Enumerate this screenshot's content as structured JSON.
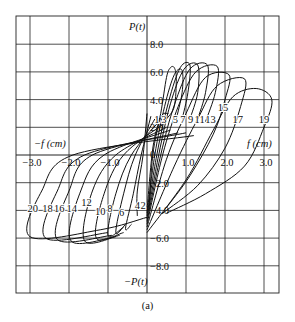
{
  "chart_data": {
    "type": "line",
    "title": "",
    "caption": "(a)",
    "xlabel_pos": "f (cm)",
    "xlabel_neg": "−f (cm)",
    "ylabel_pos": "P(t)",
    "ylabel_neg": "−P(t)",
    "xlim": [
      -3.3,
      3.4
    ],
    "ylim": [
      -10.0,
      10.2
    ],
    "grid": true,
    "x_ticks": [
      -3.0,
      -2.0,
      -1.0,
      0,
      1.0,
      2.0,
      3.0
    ],
    "x_tick_labels": [
      "−3.0",
      "−2.0",
      "−1.0",
      "0",
      "1.0",
      "2.0",
      "3.0"
    ],
    "y_ticks": [
      8.0,
      6.0,
      4.0,
      2.0,
      0,
      -2.0,
      -4.0,
      -6.0,
      -8.0
    ],
    "y_tick_labels": [
      "8.0",
      "6.0",
      "4.0",
      "2.0",
      "0",
      "−2.0",
      "−4.0",
      "−6.0",
      "−8.0"
    ],
    "legend": "Cycle numbers labeled on curves: odd 1–19 (loading, positive), even 2–20 (reverse loading, negative)",
    "series": [
      {
        "name": "1",
        "points": [
          [
            0.05,
            -4.0
          ],
          [
            0.15,
            0.0
          ],
          [
            0.35,
            2.7
          ],
          [
            0.55,
            3.0
          ]
        ],
        "label_at": [
          0.25,
          2.3
        ]
      },
      {
        "name": "3",
        "points": [
          [
            0.0,
            -4.0
          ],
          [
            0.15,
            0.5
          ],
          [
            0.35,
            3.0
          ],
          [
            0.5,
            5.6
          ],
          [
            0.6,
            6.3
          ],
          [
            0.7,
            6.3
          ],
          [
            0.75,
            5.5
          ],
          [
            0.7,
            3.5
          ],
          [
            0.5,
            2.6
          ]
        ],
        "label_at": [
          0.43,
          2.3
        ]
      },
      {
        "name": "5",
        "points": [
          [
            0.0,
            -4.2
          ],
          [
            0.2,
            0.0
          ],
          [
            0.45,
            3.5
          ],
          [
            0.7,
            5.8
          ],
          [
            0.9,
            6.1
          ],
          [
            0.9,
            4.5
          ],
          [
            0.75,
            2.6
          ]
        ],
        "label_at": [
          0.73,
          2.3
        ]
      },
      {
        "name": "7",
        "points": [
          [
            0.0,
            -4.4
          ],
          [
            0.25,
            0.0
          ],
          [
            0.55,
            3.8
          ],
          [
            0.85,
            6.3
          ],
          [
            1.1,
            6.5
          ],
          [
            1.05,
            4.5
          ],
          [
            0.9,
            2.6
          ]
        ],
        "label_at": [
          0.92,
          2.3
        ]
      },
      {
        "name": "9",
        "points": [
          [
            0.0,
            -4.6
          ],
          [
            0.3,
            0.0
          ],
          [
            0.6,
            3.7
          ],
          [
            0.95,
            6.2
          ],
          [
            1.3,
            6.5
          ],
          [
            1.3,
            4.5
          ],
          [
            1.1,
            2.6
          ]
        ],
        "label_at": [
          1.12,
          2.3
        ]
      },
      {
        "name": "11",
        "points": [
          [
            0.0,
            -4.8
          ],
          [
            0.35,
            0.0
          ],
          [
            0.7,
            3.6
          ],
          [
            1.1,
            6.2
          ],
          [
            1.55,
            6.5
          ],
          [
            1.5,
            4.5
          ],
          [
            1.3,
            2.6
          ]
        ],
        "label_at": [
          1.35,
          2.3
        ]
      },
      {
        "name": "13",
        "points": [
          [
            0.0,
            -5.0
          ],
          [
            0.4,
            0.0
          ],
          [
            0.8,
            3.5
          ],
          [
            1.25,
            6.0
          ],
          [
            1.8,
            6.4
          ],
          [
            1.75,
            4.5
          ],
          [
            1.5,
            2.4
          ]
        ],
        "label_at": [
          1.63,
          2.3
        ]
      },
      {
        "name": "15",
        "points": [
          [
            0.0,
            -5.2
          ],
          [
            0.5,
            -0.3
          ],
          [
            1.0,
            3.0
          ],
          [
            1.5,
            5.6
          ],
          [
            2.1,
            5.8
          ],
          [
            2.0,
            4.0
          ],
          [
            1.7,
            1.5
          ],
          [
            1.1,
            -1.5
          ],
          [
            0.5,
            -3.8
          ]
        ],
        "label_at": [
          1.95,
          3.2
        ]
      },
      {
        "name": "17",
        "points": [
          [
            0.0,
            -5.4
          ],
          [
            0.7,
            -0.8
          ],
          [
            1.3,
            2.6
          ],
          [
            1.8,
            5.0
          ],
          [
            2.5,
            5.5
          ],
          [
            2.4,
            3.5
          ],
          [
            2.0,
            0.5
          ],
          [
            1.3,
            -2.2
          ],
          [
            0.4,
            -4.2
          ]
        ],
        "label_at": [
          2.33,
          2.3
        ]
      },
      {
        "name": "19",
        "points": [
          [
            0.0,
            -5.6
          ],
          [
            1.0,
            -1.8
          ],
          [
            1.7,
            1.8
          ],
          [
            2.2,
            4.2
          ],
          [
            2.8,
            4.8
          ],
          [
            3.2,
            4.0
          ],
          [
            3.0,
            2.0
          ],
          [
            2.5,
            -0.8
          ],
          [
            1.5,
            -2.8
          ],
          [
            0.5,
            -4.2
          ]
        ],
        "label_at": [
          3.0,
          2.3
        ]
      },
      {
        "name": "2",
        "points": [
          [
            0.0,
            3.0
          ],
          [
            -0.1,
            0.0
          ],
          [
            -0.25,
            -2.6
          ],
          [
            -0.25,
            -4.4
          ]
        ],
        "label_at": [
          -0.1,
          -3.9
        ]
      },
      {
        "name": "4",
        "points": [
          [
            0.1,
            2.8
          ],
          [
            -0.15,
            0.0
          ],
          [
            -0.35,
            -2.8
          ],
          [
            -0.55,
            -5.3
          ],
          [
            -0.4,
            -5.0
          ]
        ],
        "label_at": [
          -0.25,
          -3.9
        ]
      },
      {
        "name": "6",
        "points": [
          [
            0.2,
            2.6
          ],
          [
            -0.3,
            0.0
          ],
          [
            -0.6,
            -2.8
          ],
          [
            -0.8,
            -5.6
          ],
          [
            -0.55,
            -5.0
          ]
        ],
        "label_at": [
          -0.65,
          -4.4
        ]
      },
      {
        "name": "8",
        "points": [
          [
            0.3,
            2.4
          ],
          [
            -0.4,
            0.0
          ],
          [
            -0.8,
            -2.8
          ],
          [
            -1.0,
            -5.8
          ],
          [
            -0.6,
            -5.2
          ]
        ],
        "label_at": [
          -0.95,
          -4.1
        ]
      },
      {
        "name": "10",
        "points": [
          [
            0.4,
            2.2
          ],
          [
            -0.6,
            0.0
          ],
          [
            -1.1,
            -2.8
          ],
          [
            -1.3,
            -6.0
          ],
          [
            -0.6,
            -5.6
          ]
        ],
        "label_at": [
          -1.2,
          -4.3
        ]
      },
      {
        "name": "12",
        "points": [
          [
            0.5,
            2.0
          ],
          [
            -0.8,
            0.0
          ],
          [
            -1.4,
            -2.6
          ],
          [
            -1.6,
            -6.2
          ],
          [
            -0.7,
            -5.8
          ]
        ],
        "label_at": [
          -1.55,
          -3.7
        ]
      },
      {
        "name": "14",
        "points": [
          [
            0.6,
            1.8
          ],
          [
            -1.1,
            0.0
          ],
          [
            -1.7,
            -2.6
          ],
          [
            -1.95,
            -6.2
          ],
          [
            -0.8,
            -5.9
          ]
        ],
        "label_at": [
          -1.93,
          -4.1
        ]
      },
      {
        "name": "16",
        "points": [
          [
            0.8,
            1.6
          ],
          [
            -1.4,
            0.0
          ],
          [
            -2.0,
            -2.6
          ],
          [
            -2.3,
            -6.1
          ],
          [
            -0.9,
            -5.8
          ]
        ],
        "label_at": [
          -2.25,
          -4.1
        ]
      },
      {
        "name": "18",
        "points": [
          [
            1.0,
            1.6
          ],
          [
            -1.6,
            0.0
          ],
          [
            -2.3,
            -2.6
          ],
          [
            -2.6,
            -6.0
          ],
          [
            -1.0,
            -5.6
          ]
        ],
        "label_at": [
          -2.55,
          -4.1
        ]
      },
      {
        "name": "20",
        "points": [
          [
            1.2,
            1.4
          ],
          [
            -1.9,
            0.0
          ],
          [
            -2.7,
            -2.6
          ],
          [
            -3.0,
            -5.9
          ],
          [
            -1.2,
            -5.4
          ],
          [
            0.0,
            -4.5
          ]
        ],
        "label_at": [
          -2.93,
          -4.1
        ]
      }
    ]
  }
}
